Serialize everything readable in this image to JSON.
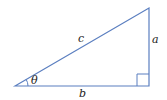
{
  "diagram": {
    "type": "right-triangle",
    "colors": {
      "stroke": "#5b7fc0",
      "text": "#222222",
      "background": "#ffffff"
    },
    "vertices": {
      "left": [
        15,
        86
      ],
      "top_right": [
        149,
        8
      ],
      "bottom_right": [
        149,
        86
      ]
    },
    "labels": {
      "hypotenuse": "c",
      "opposite": "a",
      "adjacent": "b",
      "angle": "θ"
    },
    "right_angle_marker": true
  }
}
